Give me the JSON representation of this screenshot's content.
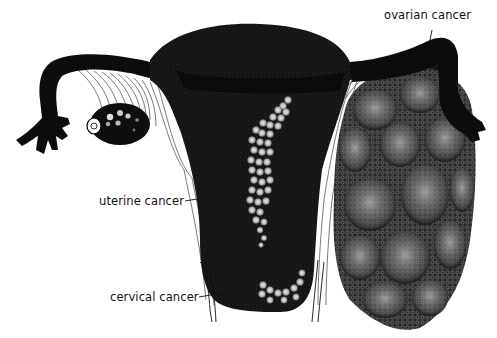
{
  "figure": {
    "type": "anatomical illustration",
    "background": "#ffffff",
    "ink": "#0a0a0a",
    "labels": [
      {
        "id": "ovarian",
        "text": "ovarian cancer",
        "x": 412,
        "y": 7
      },
      {
        "id": "uterine",
        "text": "uterine cancer",
        "x": 99,
        "y": 194
      },
      {
        "id": "cervical",
        "text": "cervical cancer",
        "x": 110,
        "y": 290
      }
    ]
  }
}
